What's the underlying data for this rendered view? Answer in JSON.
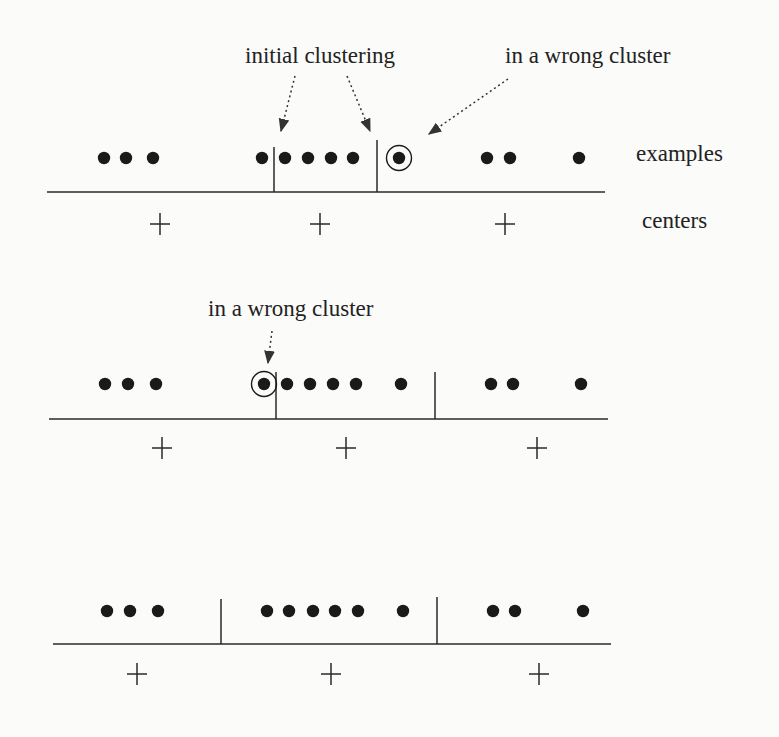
{
  "figure": {
    "width": 779,
    "height": 737,
    "labels": {
      "examples": "examples",
      "centers": "centers"
    },
    "annotations": [
      {
        "id": "initial-clustering",
        "text": "initial clustering",
        "x": 245,
        "y": 63
      },
      {
        "id": "wrong-cluster-1",
        "text": "in a wrong cluster",
        "x": 505,
        "y": 63
      },
      {
        "id": "wrong-cluster-2",
        "text": "in a wrong cluster",
        "x": 208,
        "y": 316
      }
    ],
    "arrows": [
      {
        "from": [
          295,
          76
        ],
        "to": [
          281,
          131
        ]
      },
      {
        "from": [
          347,
          76
        ],
        "to": [
          370,
          131
        ]
      },
      {
        "from": [
          508,
          79
        ],
        "to": [
          429,
          134
        ]
      },
      {
        "from": [
          272,
          331
        ],
        "to": [
          268,
          363
        ]
      }
    ],
    "rows": [
      {
        "name": "row-1-initial",
        "dot_y": 158,
        "axis_y": 192,
        "axis_x": [
          47,
          605
        ],
        "center_y": 224,
        "dividers": [
          {
            "x": 274,
            "top": 147
          },
          {
            "x": 377,
            "top": 140
          }
        ],
        "dots": [
          104,
          126,
          153,
          262,
          285,
          308,
          331,
          353,
          399,
          487,
          510,
          579
        ],
        "circled": [
          399
        ],
        "centers": [
          160,
          320,
          505
        ],
        "show_labels": true
      },
      {
        "name": "row-2",
        "dot_y": 384,
        "axis_y": 419,
        "axis_x": [
          49,
          608
        ],
        "center_y": 448,
        "dividers": [
          {
            "x": 276,
            "top": 372
          },
          {
            "x": 435,
            "top": 372
          }
        ],
        "dots": [
          105,
          128,
          156,
          264,
          287,
          310,
          333,
          356,
          401,
          491,
          513,
          581
        ],
        "circled": [
          264
        ],
        "centers": [
          162,
          346,
          537
        ],
        "show_labels": false
      },
      {
        "name": "row-3",
        "dot_y": 611,
        "axis_y": 644,
        "axis_x": [
          53,
          611
        ],
        "center_y": 674,
        "dividers": [
          {
            "x": 221,
            "top": 599
          },
          {
            "x": 437,
            "top": 597
          }
        ],
        "dots": [
          107,
          130,
          158,
          267,
          289,
          313,
          335,
          358,
          403,
          493,
          515,
          583
        ],
        "circled": [],
        "centers": [
          137,
          331,
          539
        ],
        "show_labels": false
      }
    ],
    "label_positions": {
      "examples": {
        "x": 636,
        "y": 161
      },
      "centers": {
        "x": 642,
        "y": 228
      }
    },
    "colors": {
      "ink": "#1a1a1a",
      "background": "#fbfbfa"
    }
  }
}
